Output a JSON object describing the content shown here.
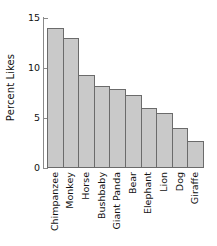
{
  "chart_data": {
    "type": "bar",
    "title": "",
    "xlabel": "",
    "ylabel": "Percent Likes",
    "ylim": [
      0,
      15
    ],
    "yticks": [
      0,
      5,
      10,
      15
    ],
    "ytick_labels": [
      "0",
      "5",
      "10",
      "15"
    ],
    "grid": false,
    "legend": false,
    "bar_fill_color": "#c9c9c9",
    "bar_edge_color": "#6b6b6b",
    "axis_color": "#8a8a8a",
    "categories": [
      "Chimpanzee",
      "Monkey",
      "Horse",
      "Bushbaby",
      "Giant Panda",
      "Bear",
      "Elephant",
      "Lion",
      "Dog",
      "Giraffe"
    ],
    "values": [
      14.0,
      13.0,
      9.3,
      8.2,
      7.9,
      7.3,
      6.0,
      5.5,
      4.0,
      2.7
    ]
  }
}
